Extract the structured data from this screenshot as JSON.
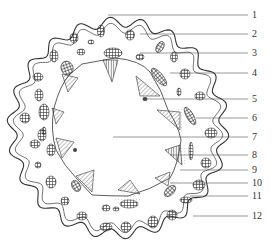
{
  "diagram": {
    "type": "cross-section line drawing",
    "colors": {
      "ink": "#3a3a3a",
      "background": "#ffffff",
      "fill": "#f4f4f4"
    },
    "callouts": [
      {
        "number": "1",
        "y": 15,
        "x_start": 108
      },
      {
        "number": "2",
        "y": 34,
        "x_start": 140
      },
      {
        "number": "3",
        "y": 53,
        "x_start": 140
      },
      {
        "number": "4",
        "y": 73,
        "x_start": 170
      },
      {
        "number": "5",
        "y": 99,
        "x_start": 145
      },
      {
        "number": "6",
        "y": 118,
        "x_start": 196
      },
      {
        "number": "7",
        "y": 137,
        "x_start": 113
      },
      {
        "number": "8",
        "y": 155,
        "x_start": 170
      },
      {
        "number": "9",
        "y": 170,
        "x_start": 180
      },
      {
        "number": "10",
        "y": 183,
        "x_start": 170
      },
      {
        "number": "11",
        "y": 196,
        "x_start": 190
      },
      {
        "number": "12",
        "y": 216,
        "x_start": 193
      }
    ]
  }
}
